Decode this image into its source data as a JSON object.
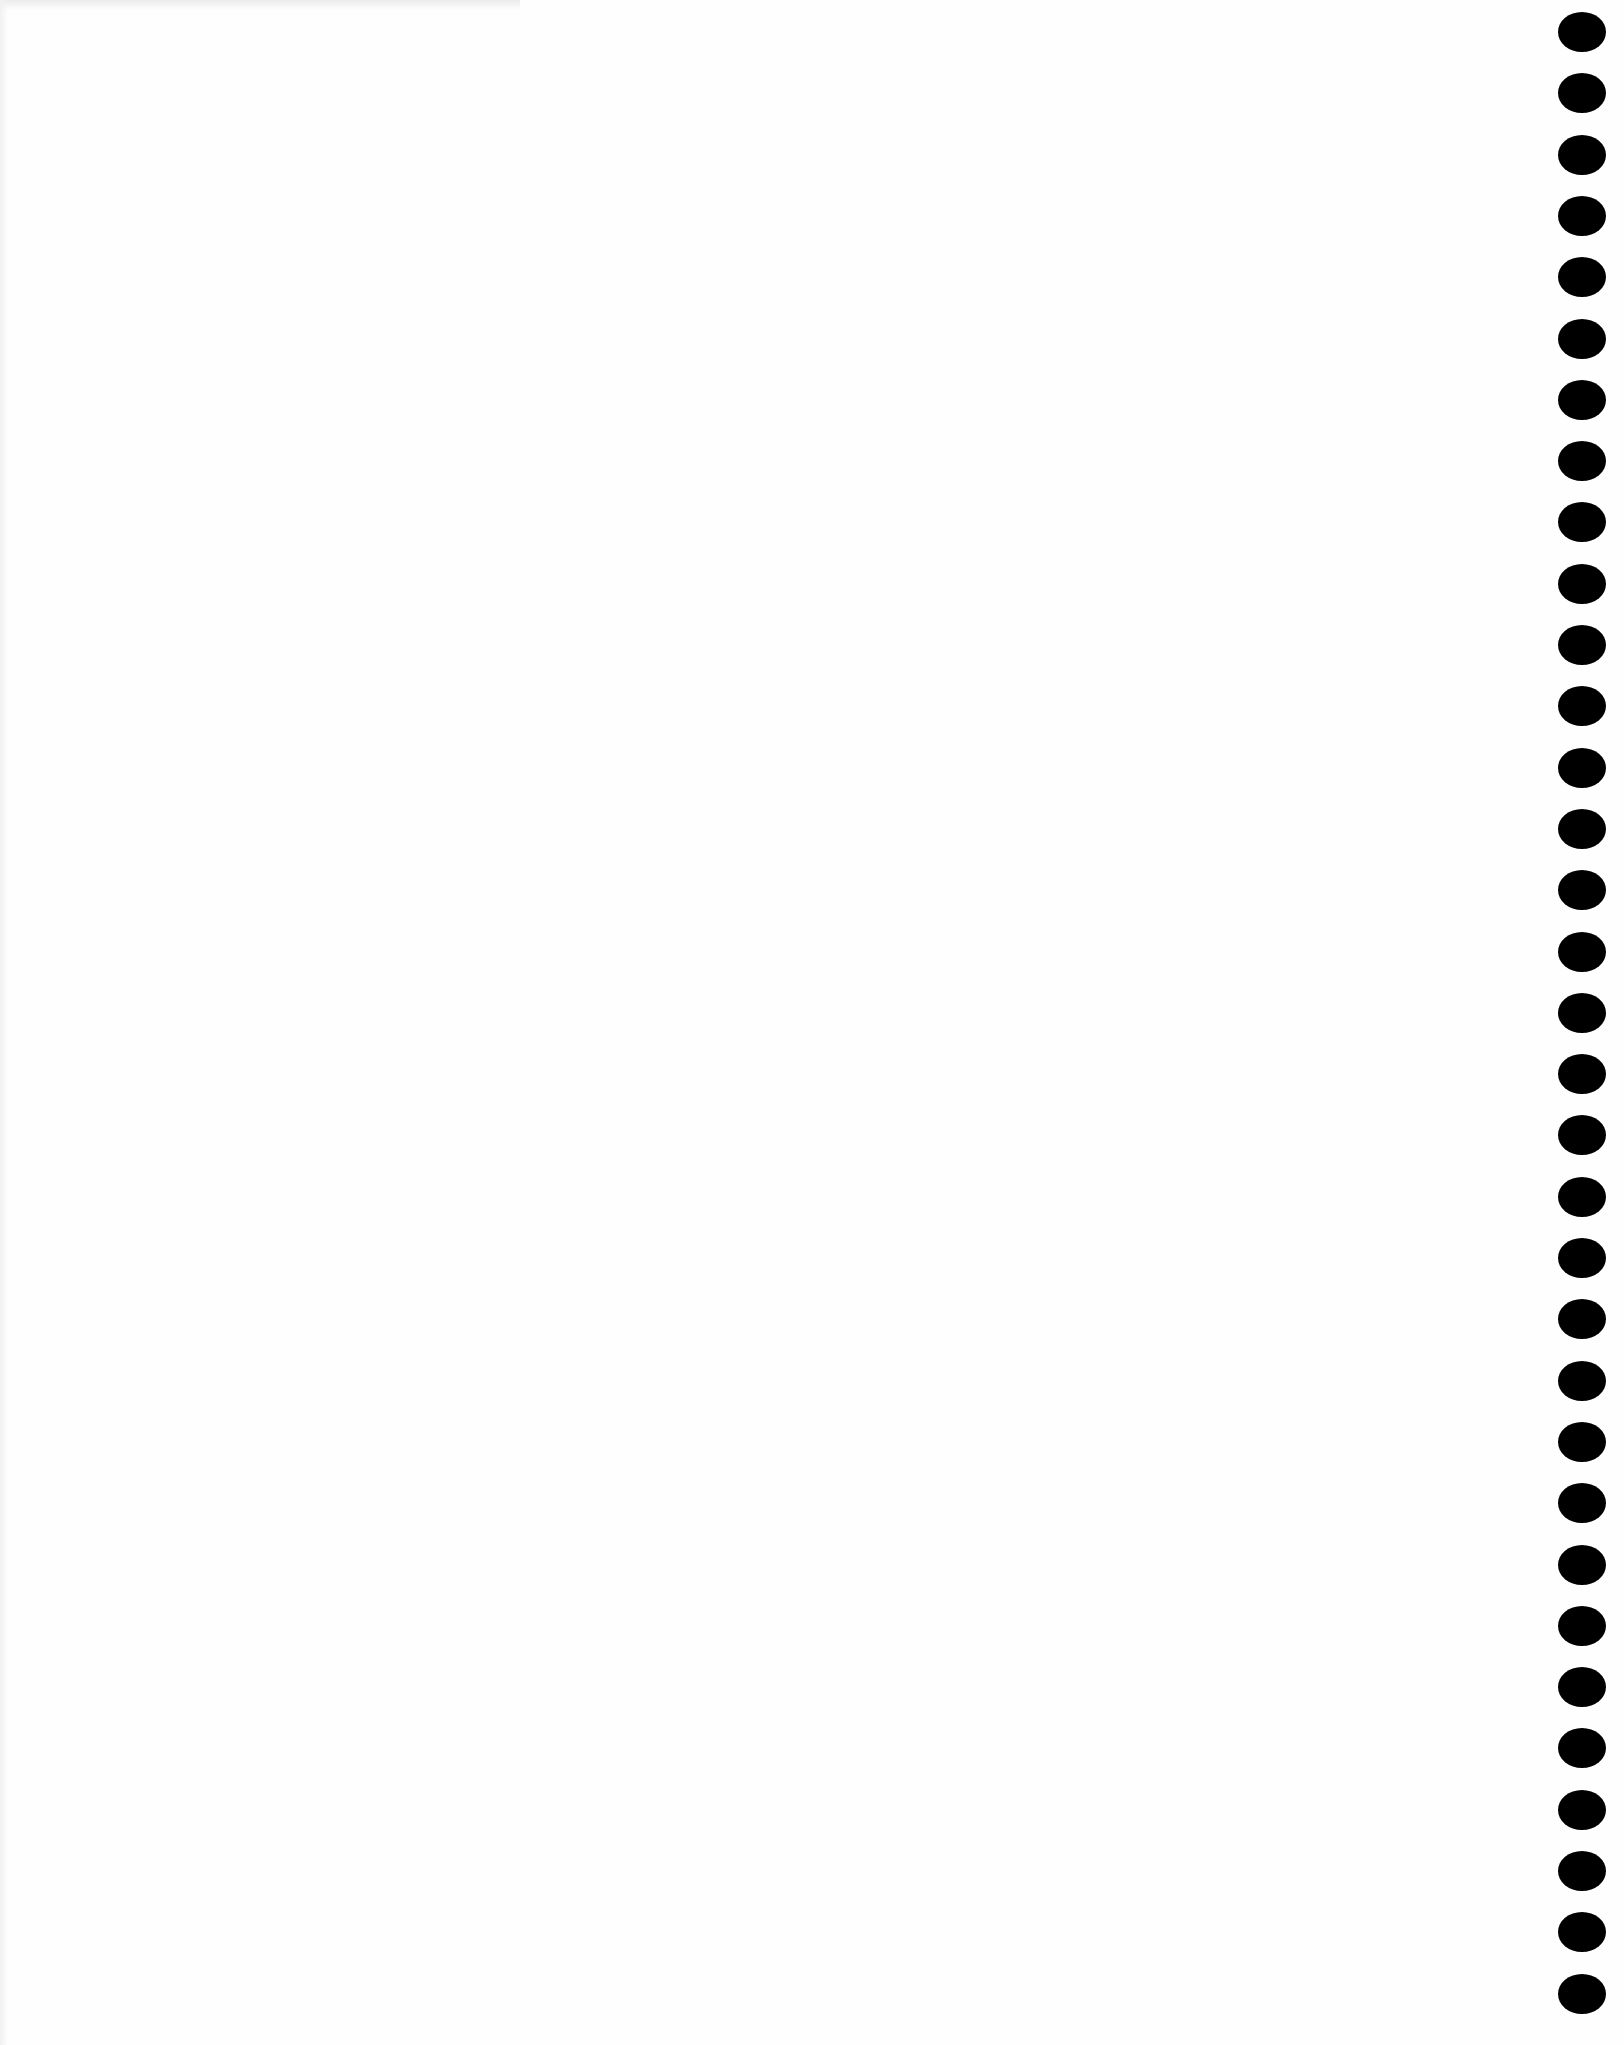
{
  "page": {
    "type": "blank scanned page",
    "background_color": "#fefefe"
  },
  "binding": {
    "side": "right",
    "hole_count": 33,
    "hole_color": "#000000",
    "first_hole_top": 12,
    "spacing": 61.3
  }
}
